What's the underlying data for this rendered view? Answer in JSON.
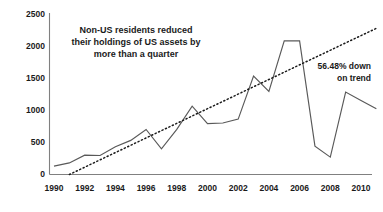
{
  "chart_data": {
    "type": "line",
    "title": "",
    "xlabel": "",
    "ylabel": "",
    "xlim": [
      1990,
      2011
    ],
    "ylim": [
      0,
      2500
    ],
    "grid": false,
    "legend": "none",
    "y_ticks": [
      0,
      500,
      1000,
      1500,
      2000,
      2500
    ],
    "y_tick_labels": [
      "0",
      "500",
      "1000",
      "1500",
      "2000",
      "2500"
    ],
    "x_ticks": [
      1990,
      1992,
      1994,
      1996,
      1998,
      2000,
      2002,
      2004,
      2006,
      2008,
      2010
    ],
    "x_tick_labels": [
      "1990",
      "1992",
      "1994",
      "1996",
      "1998",
      "2000",
      "2002",
      "2004",
      "2006",
      "2008",
      "2010"
    ],
    "series": [
      {
        "name": "US assets held by non-US residents",
        "style": "solid",
        "color": "#595959",
        "x": [
          1990,
          1991,
          1992,
          1993,
          1994,
          1995,
          1996,
          1997,
          1998,
          1999,
          2000,
          2001,
          2002,
          2003,
          2004,
          2005,
          2006,
          2007,
          2008,
          2009,
          2010,
          2011
        ],
        "values": [
          130,
          180,
          300,
          295,
          430,
          530,
          700,
          400,
          700,
          1060,
          790,
          800,
          860,
          1530,
          1290,
          2075,
          2075,
          440,
          270,
          1280,
          1150,
          1020
        ]
      },
      {
        "name": "Trend",
        "style": "dotted",
        "color": "#1a1a1a",
        "x": [
          1991,
          2011
        ],
        "values": [
          0,
          2270
        ]
      }
    ],
    "annotations": [
      {
        "name": "headline-note",
        "lines": [
          "Non-US residents reduced",
          "their holdings of US assets by",
          "more than a quarter"
        ],
        "x": 1996.1,
        "y": 2190
      },
      {
        "name": "trend-note",
        "lines": [
          "56.48% down",
          "on trend"
        ],
        "x": 2009.6,
        "y": 1620
      }
    ]
  },
  "colors": {
    "series": "#595959",
    "trend": "#1a1a1a",
    "axis": "#808080",
    "text": "#1a1a1a",
    "background": "#ffffff"
  }
}
